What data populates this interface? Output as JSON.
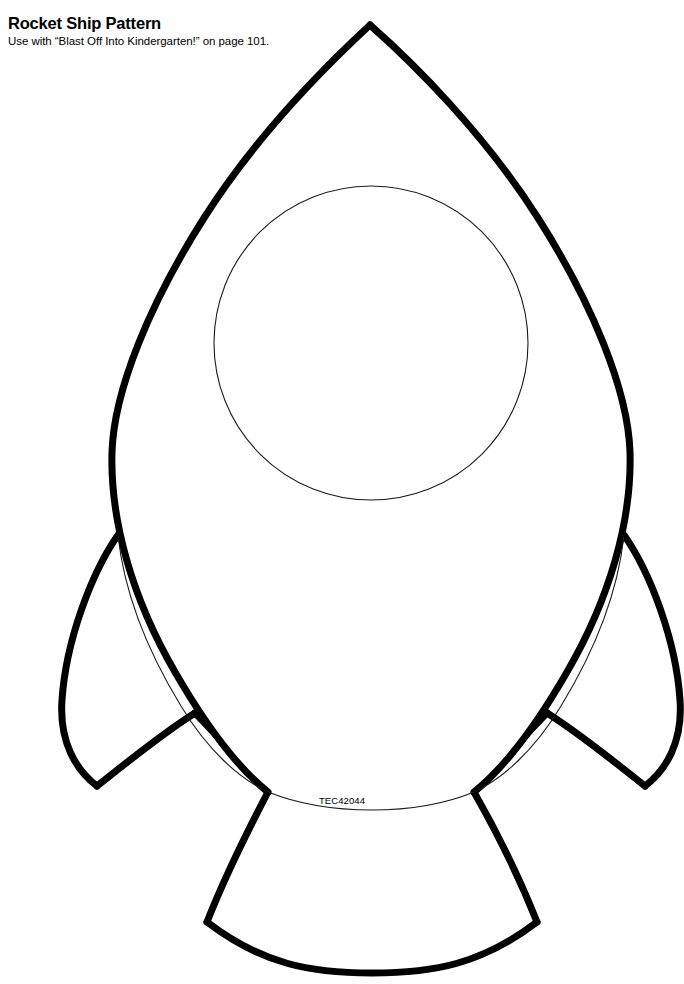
{
  "page": {
    "width": 684,
    "height": 984,
    "background_color": "#ffffff",
    "ink_color": "#000000"
  },
  "header": {
    "title": "Rocket Ship Pattern",
    "subtitle": "Use with “Blast Off Into Kindergarten!” on page 101."
  },
  "artwork": {
    "name": "rocket-ship-pattern",
    "description": "Black outline line-art pattern of a rocket ship with a teardrop body, a round porthole window, two side fins and a flared exhaust nozzle",
    "stroke_color": "#000000",
    "fill_color": "#ffffff",
    "heavy_stroke_width": 7,
    "thin_stroke_width": 1.1,
    "parts": [
      {
        "name": "rocket-body",
        "nose_tip": [
          370,
          25
        ],
        "widest_left_x": 112,
        "widest_right_x": 630,
        "widest_y": 460,
        "bottom_left": [
          268,
          792
        ],
        "bottom_right": [
          474,
          792
        ]
      },
      {
        "name": "porthole-window",
        "center": [
          371,
          343
        ],
        "radius": 157
      },
      {
        "name": "left-fin",
        "top_attach": [
          118,
          535
        ],
        "tip": [
          97,
          785
        ],
        "inner_corner": [
          195,
          713
        ]
      },
      {
        "name": "right-fin",
        "top_attach": [
          624,
          535
        ],
        "tip": [
          645,
          785
        ],
        "inner_corner": [
          547,
          713
        ]
      },
      {
        "name": "exhaust-nozzle",
        "top_left": [
          268,
          792
        ],
        "top_right": [
          474,
          792
        ],
        "bottom_left": [
          207,
          922
        ],
        "bottom_right": [
          537,
          922
        ],
        "bottom_center_y": 972
      }
    ]
  },
  "footer": {
    "catalog_code": "TEC42044"
  }
}
